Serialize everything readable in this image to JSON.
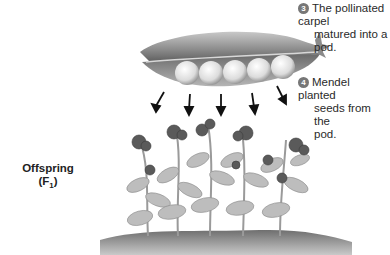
{
  "steps": [
    {
      "number": "3",
      "line1": "The pollinated carpel",
      "line2": "matured into a pod."
    },
    {
      "number": "4",
      "line1": "Mendel planted",
      "line2": "seeds from the",
      "line3": "pod."
    }
  ],
  "offspring": {
    "label": "Offspring",
    "generation": "(F",
    "subscript": "1",
    "close": ")"
  },
  "illustration": {
    "pod_seed_count": 5,
    "arrow_count": 5,
    "plant_count": 5,
    "colors": {
      "pod": "#8a8a8a",
      "seed": "#e6e6e6",
      "leaf": "#b9b9b9",
      "flower": "#5a5a5a",
      "soil": "#7a7a7a",
      "arrow": "#111111"
    }
  }
}
